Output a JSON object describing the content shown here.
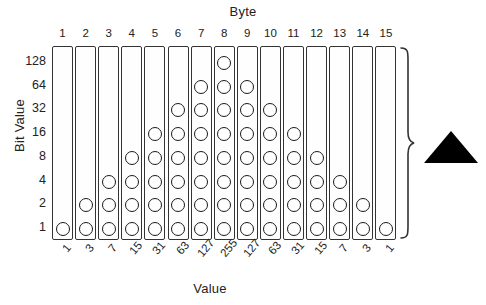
{
  "figure": {
    "top_axis_title": "Byte",
    "bottom_axis_title": "Value",
    "left_axis_title": "Bit Value",
    "brace_icon": "right-curly-brace",
    "marker_icon": "solid-triangle-up",
    "ink_color": "#1a1a1a",
    "background_color": "#ffffff"
  },
  "chart_data": {
    "type": "heatmap",
    "title": "",
    "xlabel": "Byte",
    "ylabel": "Bit Value",
    "secondary_xlabel": "Value",
    "grid": false,
    "legend": "none",
    "categories": [
      "1",
      "2",
      "3",
      "4",
      "5",
      "6",
      "7",
      "8",
      "9",
      "10",
      "11",
      "12",
      "13",
      "14",
      "15"
    ],
    "bit_rows": [
      128,
      64,
      32,
      16,
      8,
      4,
      2,
      1
    ],
    "values": [
      1,
      3,
      7,
      15,
      31,
      63,
      127,
      255,
      127,
      63,
      31,
      15,
      7,
      3,
      1
    ],
    "bits_set_per_byte": [
      1,
      2,
      3,
      4,
      5,
      6,
      7,
      8,
      7,
      6,
      5,
      4,
      3,
      2,
      1
    ],
    "matrix": [
      [
        0,
        0,
        0,
        0,
        0,
        0,
        0,
        1,
        0,
        0,
        0,
        0,
        0,
        0,
        0
      ],
      [
        0,
        0,
        0,
        0,
        0,
        0,
        1,
        1,
        1,
        0,
        0,
        0,
        0,
        0,
        0
      ],
      [
        0,
        0,
        0,
        0,
        0,
        1,
        1,
        1,
        1,
        1,
        0,
        0,
        0,
        0,
        0
      ],
      [
        0,
        0,
        0,
        0,
        1,
        1,
        1,
        1,
        1,
        1,
        1,
        0,
        0,
        0,
        0
      ],
      [
        0,
        0,
        0,
        1,
        1,
        1,
        1,
        1,
        1,
        1,
        1,
        1,
        0,
        0,
        0
      ],
      [
        0,
        0,
        1,
        1,
        1,
        1,
        1,
        1,
        1,
        1,
        1,
        1,
        1,
        0,
        0
      ],
      [
        0,
        1,
        1,
        1,
        1,
        1,
        1,
        1,
        1,
        1,
        1,
        1,
        1,
        1,
        0
      ],
      [
        1,
        1,
        1,
        1,
        1,
        1,
        1,
        1,
        1,
        1,
        1,
        1,
        1,
        1,
        1
      ]
    ]
  }
}
